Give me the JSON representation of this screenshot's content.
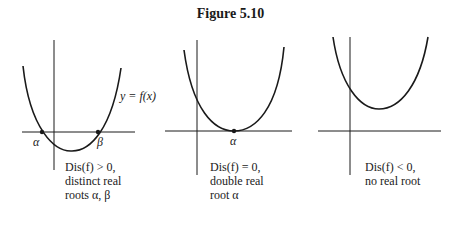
{
  "figure": {
    "title": "Figure 5.10",
    "panels": [
      {
        "id": "positive",
        "curve_label": "y = f(x)",
        "root_labels": [
          "α",
          "β"
        ],
        "caption": [
          "Dis(f) > 0,",
          "distinct real",
          "roots α, β"
        ]
      },
      {
        "id": "zero",
        "root_labels": [
          "α"
        ],
        "caption": [
          "Dis(f) = 0,",
          "double real",
          "root α"
        ]
      },
      {
        "id": "negative",
        "root_labels": [],
        "caption": [
          "Dis(f) < 0,",
          "no real root"
        ]
      }
    ],
    "colors": {
      "line": "#1a1a1a",
      "background": "#ffffff"
    }
  }
}
